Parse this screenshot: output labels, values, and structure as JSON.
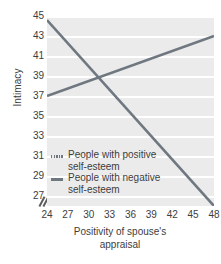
{
  "chart_data": {
    "type": "line",
    "title": "",
    "xlabel": "Positivity of spouse's appraisal",
    "xlabel_line1": "Positivity of spouse's",
    "xlabel_line2": "appraisal",
    "ylabel": "Intimacy",
    "xlim": [
      24,
      48
    ],
    "ylim": [
      26,
      45
    ],
    "xticks": [
      24,
      27,
      30,
      33,
      36,
      39,
      42,
      45,
      48
    ],
    "yticks": [
      45,
      43,
      41,
      39,
      37,
      35,
      33,
      31,
      29,
      27
    ],
    "grid": "horizontal",
    "legend_position": "inside-lower-left",
    "axis_break": "y-axis break below 27",
    "series": [
      {
        "name": "People with positive self-esteem",
        "legend_line1": "People with positive",
        "legend_line2": "self-esteem",
        "style": "dashed",
        "color": "#6f7880",
        "x": [
          24,
          48
        ],
        "y": [
          37.0,
          43.0
        ]
      },
      {
        "name": "People with negative self-esteem",
        "legend_line1": "People with negative",
        "legend_line2": "self-esteem",
        "style": "solid",
        "color": "#6f7880",
        "x": [
          24,
          48
        ],
        "y": [
          44.6,
          26.0
        ]
      }
    ],
    "intersection": {
      "x": 31.6,
      "y": 38.8
    },
    "colors": {
      "plot_background": "#ebebeb",
      "gridline": "#ffffff",
      "line": "#6f7880",
      "text": "#3d3d3d",
      "page_background": "#ffffff"
    }
  }
}
